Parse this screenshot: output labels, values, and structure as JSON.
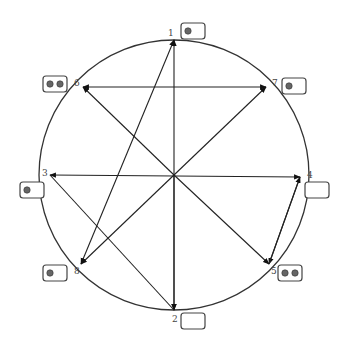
{
  "diagram": {
    "type": "circle-network",
    "circle": {
      "cx": 174,
      "cy": 175,
      "r": 135
    },
    "center": {
      "x": 174,
      "y": 175
    },
    "nodes": [
      {
        "id": "1",
        "label": "1",
        "x": 174,
        "y": 40,
        "lx": 168,
        "ly": 36,
        "box": {
          "x": 181,
          "y": 23,
          "dots": 1
        }
      },
      {
        "id": "2",
        "label": "2",
        "x": 174,
        "y": 310,
        "lx": 172,
        "ly": 322,
        "box": {
          "x": 181,
          "y": 313,
          "dots": 0
        }
      },
      {
        "id": "3",
        "label": "3",
        "x": 50,
        "y": 175,
        "lx": 42,
        "ly": 176,
        "box": {
          "x": 20,
          "y": 182,
          "dots": 1
        }
      },
      {
        "id": "4",
        "label": "4",
        "x": 300,
        "y": 177,
        "lx": 307,
        "ly": 178,
        "box": {
          "x": 305,
          "y": 182,
          "dots": 0
        }
      },
      {
        "id": "5",
        "label": "5",
        "x": 269,
        "y": 264,
        "lx": 271,
        "ly": 274,
        "box": {
          "x": 278,
          "y": 265,
          "dots": 2
        }
      },
      {
        "id": "6",
        "label": "6",
        "x": 83,
        "y": 87,
        "lx": 74,
        "ly": 86,
        "box": {
          "x": 43,
          "y": 76,
          "dots": 2
        }
      },
      {
        "id": "7",
        "label": "7",
        "x": 266,
        "y": 87,
        "lx": 272,
        "ly": 86,
        "box": {
          "x": 282,
          "y": 78,
          "dots": 1
        }
      },
      {
        "id": "8",
        "label": "8",
        "x": 81,
        "y": 264,
        "lx": 74,
        "ly": 274,
        "box": {
          "x": 43,
          "y": 265,
          "dots": 1
        }
      }
    ],
    "edges": [
      {
        "from": "2",
        "to": "1",
        "arrow_end": true,
        "arrow_start": true
      },
      {
        "from": "8",
        "to": "1",
        "arrow_end": true,
        "arrow_start": true
      },
      {
        "from": "7",
        "to": "6",
        "arrow_end": true,
        "arrow_start": true
      },
      {
        "from": "4",
        "to": "3",
        "arrow_end": true,
        "arrow_start": true
      },
      {
        "from": "center",
        "to": "6",
        "arrow_end": true
      },
      {
        "from": "center",
        "to": "7",
        "arrow_end": true
      },
      {
        "from": "center",
        "to": "8",
        "arrow_end": true
      },
      {
        "from": "center",
        "to": "5",
        "arrow_end": true
      },
      {
        "from": "center",
        "to": "2",
        "arrow_end": true
      },
      {
        "from": "3",
        "to": "2",
        "arrow_end": false
      },
      {
        "from": "4",
        "to": "5",
        "arrow_end": true
      },
      {
        "from": "5",
        "to": "4",
        "arrow_end": true
      }
    ],
    "stroke_color": "#222222"
  }
}
